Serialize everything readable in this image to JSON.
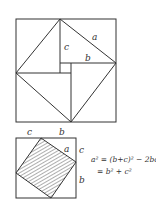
{
  "figures": {
    "top": {
      "description": "Square with inscribed tilted square formed by four right triangles around central small square",
      "labels": {
        "a": "a",
        "b": "b",
        "c": "c"
      }
    },
    "bottom": {
      "description": "Square with inscribed hatched tilted square",
      "labels": {
        "top_c": "c",
        "top_b": "b",
        "side_a": "a",
        "right_c": "c",
        "right_b": "b"
      }
    }
  },
  "equations": {
    "line1": "a² = (b+c)² − 2bc",
    "line2": "= b² + c²"
  },
  "colors": {
    "stroke": "#333333",
    "background": "#ffffff"
  }
}
